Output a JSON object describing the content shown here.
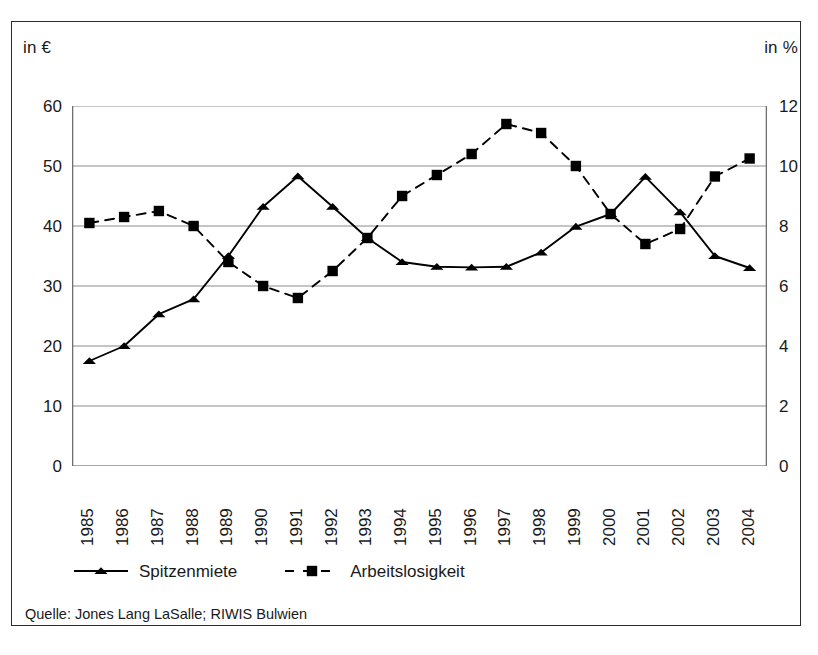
{
  "figure": {
    "left_unit": "in €",
    "right_unit": "in %",
    "source": "Quelle: Jones Lang LaSalle; RIWIS Bulwien"
  },
  "legend": {
    "position": "bottom-left",
    "items": [
      {
        "label": "Spitzenmiete",
        "marker": "triangle",
        "line": "solid",
        "color": "#000000"
      },
      {
        "label": "Arbeitslosigkeit",
        "marker": "square",
        "line": "dashed",
        "color": "#000000"
      }
    ]
  },
  "chart_data": {
    "type": "line",
    "title": "",
    "subtitle": "",
    "xlabel": "",
    "ylabel": "in €",
    "y2label": "in %",
    "grid": true,
    "ylim": [
      0,
      60
    ],
    "y2lim": [
      0,
      12
    ],
    "yticks": [
      0,
      10,
      20,
      30,
      40,
      50,
      60
    ],
    "y2ticks": [
      0,
      2,
      4,
      6,
      8,
      10,
      12
    ],
    "categories": [
      "1985",
      "1986",
      "1987",
      "1988",
      "1989",
      "1990",
      "1991",
      "1992",
      "1993",
      "1994",
      "1995",
      "1996",
      "1997",
      "1998",
      "1999",
      "2000",
      "2001",
      "2002",
      "2003",
      "2004"
    ],
    "series": [
      {
        "name": "Spitzenmiete",
        "axis": "left",
        "unit": "€",
        "marker": "triangle",
        "line": "solid",
        "values": [
          17.5,
          20.0,
          25.3,
          27.8,
          35.0,
          43.2,
          48.3,
          43.2,
          38.0,
          34.0,
          33.2,
          33.1,
          33.2,
          35.6,
          39.9,
          42.0,
          48.2,
          42.3,
          35.0,
          33.0
        ]
      },
      {
        "name": "Arbeitslosigkeit",
        "axis": "right",
        "unit": "%",
        "marker": "square",
        "line": "dashed",
        "values": [
          8.1,
          8.3,
          8.5,
          8.0,
          6.8,
          6.0,
          5.6,
          6.5,
          7.6,
          9.0,
          9.7,
          10.4,
          11.4,
          11.1,
          10.0,
          8.4,
          7.4,
          7.9,
          9.65,
          10.25
        ]
      }
    ],
    "source": "Quelle: Jones Lang LaSalle; RIWIS Bulwien"
  }
}
